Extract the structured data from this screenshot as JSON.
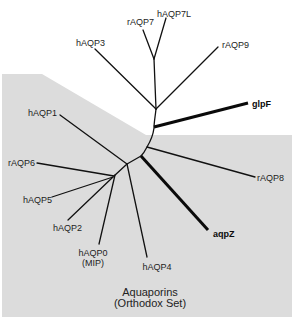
{
  "diagram": {
    "type": "unrooted phylogenetic tree",
    "caption_line1": "Aquaporins",
    "caption_line2": "(Orthodox Set)",
    "shaded_region_color": "#dcdcdc",
    "branch_color": "#111111"
  },
  "leaves": {
    "hAQP7L": "hAQP7L",
    "rAQP7": "rAQP7",
    "hAQP3": "hAQP3",
    "rAQP9": "rAQP9",
    "glpF": "glpF",
    "hAQP1": "hAQP1",
    "rAQP6": "rAQP6",
    "rAQP8": "rAQP8",
    "hAQP5": "hAQP5",
    "hAQP2": "hAQP2",
    "aqpZ": "aqpZ",
    "hAQP0": "hAQP0",
    "hAQP0_alias": "(MIP)",
    "hAQP4": "hAQP4"
  },
  "emphasized_branches": [
    "glpF",
    "aqpZ"
  ],
  "clades": {
    "unshaded_group": [
      "hAQP7L",
      "rAQP7",
      "hAQP3",
      "rAQP9",
      "glpF"
    ],
    "shaded_group_orthodox": [
      "hAQP1",
      "rAQP6",
      "hAQP5",
      "hAQP2",
      "hAQP0",
      "hAQP4",
      "aqpZ",
      "rAQP8"
    ]
  }
}
